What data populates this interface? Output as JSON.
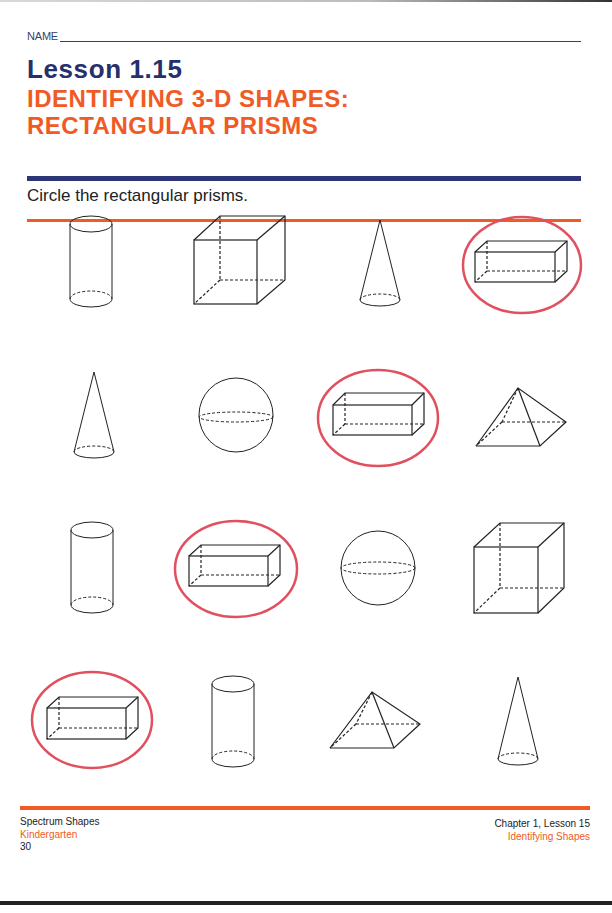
{
  "header": {
    "name_label": "NAME",
    "lesson": "Lesson 1.15",
    "title_line1": "IDENTIFYING 3-D SHAPES:",
    "title_line2": "RECTANGULAR PRISMS",
    "instruction": "Circle the rectangular prisms."
  },
  "colors": {
    "navy": "#2c3575",
    "orange": "#f05a24",
    "circle_mark": "#e0505e",
    "line": "#222222"
  },
  "shapes": [
    {
      "row": 1,
      "col": 1,
      "type": "cylinder",
      "circled": false
    },
    {
      "row": 1,
      "col": 2,
      "type": "cube",
      "circled": false
    },
    {
      "row": 1,
      "col": 3,
      "type": "cone",
      "circled": false
    },
    {
      "row": 1,
      "col": 4,
      "type": "rectangular-prism",
      "circled": true
    },
    {
      "row": 2,
      "col": 1,
      "type": "cone",
      "circled": false
    },
    {
      "row": 2,
      "col": 2,
      "type": "sphere",
      "circled": false
    },
    {
      "row": 2,
      "col": 3,
      "type": "rectangular-prism",
      "circled": true
    },
    {
      "row": 2,
      "col": 4,
      "type": "square-pyramid",
      "circled": false
    },
    {
      "row": 3,
      "col": 1,
      "type": "cylinder",
      "circled": false
    },
    {
      "row": 3,
      "col": 2,
      "type": "rectangular-prism",
      "circled": true
    },
    {
      "row": 3,
      "col": 3,
      "type": "sphere",
      "circled": false
    },
    {
      "row": 3,
      "col": 4,
      "type": "cube",
      "circled": false
    },
    {
      "row": 4,
      "col": 1,
      "type": "rectangular-prism",
      "circled": true
    },
    {
      "row": 4,
      "col": 2,
      "type": "cylinder",
      "circled": false
    },
    {
      "row": 4,
      "col": 3,
      "type": "square-pyramid",
      "circled": false
    },
    {
      "row": 4,
      "col": 4,
      "type": "cone",
      "circled": false
    }
  ],
  "footer": {
    "book": "Spectrum Shapes",
    "grade": "Kindergarten",
    "page": "30",
    "chapter": "Chapter 1, Lesson 15",
    "topic": "Identifying Shapes"
  }
}
